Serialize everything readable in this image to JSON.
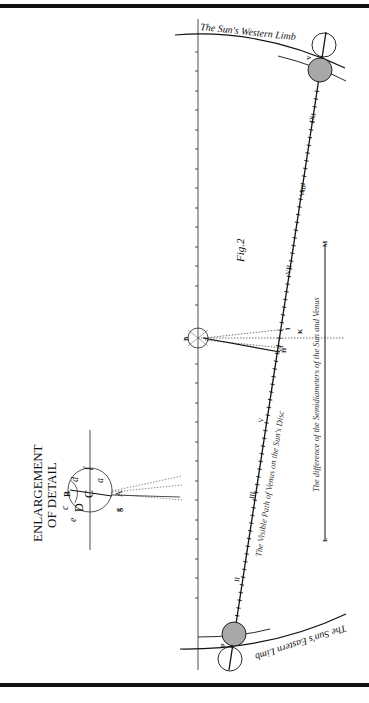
{
  "figure": {
    "title": "Fig.2",
    "enlargement_title_line1": "ENLARGEMENT",
    "enlargement_title_line2": "OF DETAIL",
    "western_limb_label": "The Sun's Western Limb",
    "eastern_limb_label": "The Sun's Eastern Limb",
    "path_label": "The Visible Path of Venus on the Sun's Disc",
    "semidiameter_label": "The difference of the Semidiameters of the Sun and Venus"
  },
  "path_hour_marks": [
    "II",
    "III",
    "V",
    "VI",
    "VII",
    "VIII",
    "IX"
  ],
  "point_labels": {
    "center": "B",
    "k": "K",
    "i": "I",
    "h": "H",
    "l": "L",
    "m": "M",
    "p": "p",
    "v": "V"
  },
  "detail_labels": {
    "B": "B",
    "C": "C",
    "D": "D",
    "c": "c",
    "d": "d",
    "e": "e",
    "f": "f",
    "a": "a",
    "A": "A",
    "g": "g"
  },
  "colors": {
    "ink": "#1a1a1a",
    "venus_fill": "#a8a8a8",
    "background": "#ffffff",
    "dotted": "#333333"
  }
}
